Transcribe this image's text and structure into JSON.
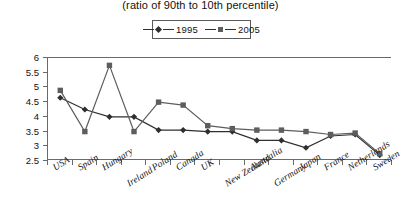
{
  "title": {
    "subtitle": "(ratio of 90th to 10th percentile)"
  },
  "legend": {
    "position": "top-center",
    "entries": [
      {
        "label": "1995",
        "marker": "diamond-marker-icon",
        "color": "#2f2f2f"
      },
      {
        "label": "2005",
        "marker": "square-marker-icon",
        "color": "#5d5d5d"
      }
    ]
  },
  "yaxis": {
    "ticks": [
      "6",
      "5.5",
      "5",
      "4.5",
      "4",
      "3.5",
      "3",
      "2.5"
    ]
  },
  "chart_data": {
    "type": "line",
    "title": "(ratio of 90th to 10th percentile)",
    "xlabel": "",
    "ylabel": "",
    "ylim": [
      2.5,
      6
    ],
    "ytick_step": 0.5,
    "grid": false,
    "legend_position": "top-center",
    "categories": [
      "USA",
      "Spain",
      "Hungary",
      "Ireland",
      "Poland",
      "Canada",
      "UK",
      "New Zealand",
      "Australia",
      "Germany",
      "Japan",
      "France",
      "Netherlands",
      "Sweden"
    ],
    "series": [
      {
        "name": "1995",
        "marker": "diamond",
        "color": "#2f2f2f",
        "values": [
          4.65,
          4.25,
          4.0,
          4.0,
          3.55,
          3.55,
          3.5,
          3.5,
          3.2,
          3.2,
          2.95,
          3.35,
          3.4,
          2.7
        ]
      },
      {
        "name": "2005",
        "marker": "square",
        "color": "#5d5d5d",
        "values": [
          4.9,
          3.5,
          5.75,
          3.5,
          4.5,
          4.4,
          3.7,
          3.6,
          3.55,
          3.55,
          3.5,
          3.4,
          3.45,
          2.75
        ]
      }
    ]
  }
}
